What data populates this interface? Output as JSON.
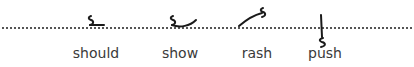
{
  "diagram": {
    "type": "shorthand-outlines",
    "baseline_style": "dotted",
    "ink_color": "#1a1a1a",
    "label_color": "#3a3a3a",
    "words": [
      {
        "label": "should",
        "outline": "sh-d",
        "position": "on-line"
      },
      {
        "label": "show",
        "outline": "sh-w-hook",
        "position": "on-line"
      },
      {
        "label": "rash",
        "outline": "r-upstroke-sh",
        "position": "above-line"
      },
      {
        "label": "push",
        "outline": "p-sh",
        "position": "through-line"
      }
    ]
  }
}
